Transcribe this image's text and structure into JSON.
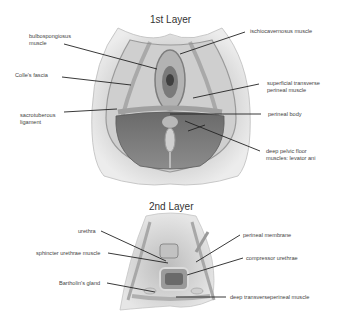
{
  "figure": {
    "layer1": {
      "title": "1st Layer",
      "labels": {
        "bulbospongiosus": [
          "bulbospongiosus",
          "muscle"
        ],
        "colles_fascia": "Colle's fascia",
        "sacrotuberous": [
          "sacrotuberous",
          "ligament"
        ],
        "ischiocavernosus": "ischiocavernosus muscle",
        "superficial_transverse": [
          "superficial transverse",
          "perineal muscle"
        ],
        "perineal_body": "perineal body",
        "deep_pelvic_floor": [
          "deep pelvic floor",
          "muscles: levator ani"
        ]
      }
    },
    "layer2": {
      "title": "2nd Layer",
      "labels": {
        "urethra": "urethra",
        "sphincter_urethrae": "sphincter urethrae muscle",
        "bartholins_gland": "Bartholin's gland",
        "perineal_membrane": "perineal membrane",
        "compressor_urethrae": "compressor urethrae",
        "deep_transverse": "deep transverseperineal muscle"
      }
    },
    "colors": {
      "background": "#ffffff",
      "leader_line": "#222222",
      "label_text": "#444444",
      "tissue_light": "#d9d9d9",
      "tissue_mid": "#a8a8a8",
      "tissue_dark": "#6e6e6e",
      "muscle_dark": "#555555"
    }
  }
}
